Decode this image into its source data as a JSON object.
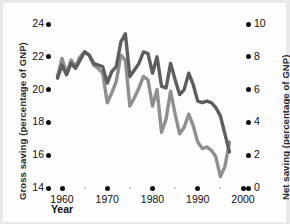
{
  "chart_data": {
    "type": "line",
    "title": "",
    "xlabel": "Year",
    "ylabel": "Gross saving (percentage of GNP)",
    "ylabel_right": "Net saving (percentage of GNP)",
    "grid": false,
    "legend_position": "none",
    "xlim": [
      1958,
      2000
    ],
    "ylim": [
      14,
      24
    ],
    "ylim_right": [
      0,
      10
    ],
    "xticks": [
      1960,
      1970,
      1980,
      1990,
      2000
    ],
    "xtick_labels": [
      "1960",
      "1970",
      "1980",
      "1990",
      "2000"
    ],
    "xminor_ticks": [
      1965,
      1975,
      1985,
      1995
    ],
    "yticks": [
      14,
      16,
      18,
      20,
      22,
      24
    ],
    "ytick_labels": [
      "14",
      "16",
      "18",
      "20",
      "22",
      "24"
    ],
    "yticks_right": [
      0,
      2,
      4,
      6,
      8,
      10
    ],
    "ytick_labels_right": [
      "0",
      "2",
      "4",
      "6",
      "8",
      "10"
    ],
    "colors": {
      "gross_saving": "#5e5e5e",
      "net_saving": "#8f8f8f",
      "axis_text": "#111111",
      "background": "#fdfdfd"
    },
    "x": [
      1959,
      1960,
      1961,
      1962,
      1963,
      1964,
      1965,
      1966,
      1967,
      1968,
      1969,
      1970,
      1971,
      1972,
      1973,
      1974,
      1975,
      1976,
      1977,
      1978,
      1979,
      1980,
      1981,
      1982,
      1983,
      1984,
      1985,
      1986,
      1987,
      1988,
      1989,
      1990,
      1991,
      1992,
      1993,
      1994,
      1995,
      1996,
      1997
    ],
    "series": [
      {
        "name": "Gross saving",
        "axis": "left",
        "units": "percentage of GNP",
        "color": "#5e5e5e",
        "values": [
          20.7,
          21.5,
          20.9,
          21.6,
          21.3,
          21.8,
          22.3,
          22.1,
          21.6,
          21.5,
          21.4,
          20.4,
          21.1,
          21.4,
          22.9,
          23.4,
          20.8,
          21.2,
          21.6,
          22.3,
          22.2,
          21.0,
          22.0,
          20.2,
          20.1,
          21.6,
          20.6,
          19.7,
          20.0,
          21.0,
          20.3,
          19.3,
          19.2,
          19.3,
          19.2,
          18.9,
          18.4,
          17.3,
          16.2
        ]
      },
      {
        "name": "Net saving",
        "axis": "right",
        "units": "percentage of GNP",
        "color": "#8f8f8f",
        "values": [
          6.8,
          7.9,
          7.0,
          7.8,
          7.4,
          8.0,
          8.3,
          8.1,
          7.5,
          7.3,
          7.0,
          5.2,
          5.8,
          6.5,
          8.1,
          7.8,
          5.0,
          5.5,
          6.1,
          6.8,
          6.6,
          5.0,
          6.0,
          3.4,
          4.2,
          5.9,
          4.5,
          3.3,
          3.7,
          4.5,
          3.8,
          2.8,
          2.4,
          2.5,
          2.3,
          1.9,
          0.7,
          1.3,
          2.8
        ]
      }
    ]
  },
  "axes": {
    "left_title": "Gross saving (percentage of GNP)",
    "right_title": "Net saving (percentage of GNP)",
    "x_title": "Year"
  }
}
